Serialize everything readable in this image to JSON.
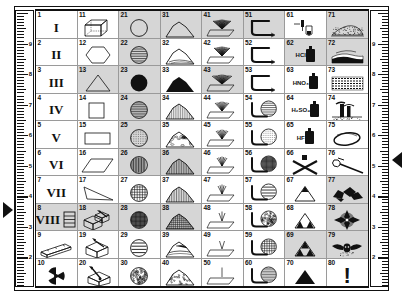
{
  "document": {
    "title": "Geological / Laboratory Symbol Legend Chart",
    "sheet_style": "boxed chart with vertical rulers on both margins"
  },
  "rulers": {
    "left": {
      "name": "left-ruler",
      "orientation": "vertical",
      "labels": [
        "9",
        "8",
        "7",
        "6",
        "5",
        "4",
        "3",
        "2",
        "1"
      ],
      "direction": "descending top to bottom",
      "minor_ticks_per_unit": 10
    },
    "right": {
      "name": "right-ruler",
      "orientation": "vertical",
      "labels": [
        "9",
        "8",
        "7",
        "6",
        "5",
        "4",
        "3",
        "2",
        "1"
      ],
      "direction": "descending top to bottom",
      "minor_ticks_per_unit": 10
    }
  },
  "markers": [
    {
      "name": "left-pointer",
      "glyph": "right-pointing-triangle",
      "side": "left"
    },
    {
      "name": "right-pointer",
      "glyph": "left-pointing-triangle",
      "side": "right"
    }
  ],
  "colors": {
    "ink": "#111111",
    "shade": "#d6d6d6",
    "gridline": "#9a9a9a",
    "paper": "#ffffff"
  },
  "grid": {
    "columns": 8,
    "rows": 10,
    "numbering": "column-major, 1-80",
    "cells": [
      {
        "n": "1",
        "icon": "roman-numeral-I",
        "text": "I",
        "shaded": false
      },
      {
        "n": "2",
        "icon": "roman-numeral-II",
        "text": "II",
        "shaded": false
      },
      {
        "n": "3",
        "icon": "roman-numeral-III",
        "text": "III",
        "shaded": false
      },
      {
        "n": "4",
        "icon": "roman-numeral-IV",
        "text": "IV",
        "shaded": false
      },
      {
        "n": "5",
        "icon": "roman-numeral-V",
        "text": "V",
        "shaded": false
      },
      {
        "n": "6",
        "icon": "roman-numeral-VI",
        "text": "VI",
        "shaded": false
      },
      {
        "n": "7",
        "icon": "roman-numeral-VII",
        "text": "VII",
        "shaded": false
      },
      {
        "n": "8",
        "icon": "roman-numeral-VIII-ladder",
        "text": "VIII",
        "shaded": true
      },
      {
        "n": "9",
        "icon": "timber-beam-icon",
        "text": "",
        "shaded": false
      },
      {
        "n": "10",
        "icon": "radioactive-trefoil-icon",
        "text": "",
        "shaded": false
      },
      {
        "n": "11",
        "icon": "wireframe-cube-icon",
        "text": "",
        "shaded": false
      },
      {
        "n": "12",
        "icon": "hexagon-outline-icon",
        "text": "",
        "shaded": false
      },
      {
        "n": "13",
        "icon": "triangle-outline-icon",
        "text": "",
        "shaded": true
      },
      {
        "n": "14",
        "icon": "square-outline-icon",
        "text": "",
        "shaded": false
      },
      {
        "n": "15",
        "icon": "rectangle-outline-icon",
        "text": "",
        "shaded": false
      },
      {
        "n": "16",
        "icon": "parallelogram-outline-icon",
        "text": "",
        "shaded": false
      },
      {
        "n": "17",
        "icon": "thin-wedge-outline-icon",
        "text": "",
        "shaded": false
      },
      {
        "n": "18",
        "icon": "boxes-with-hammer-icon",
        "text": "",
        "shaded": true
      },
      {
        "n": "19",
        "icon": "box-with-hammer-icon",
        "text": "",
        "shaded": false
      },
      {
        "n": "20",
        "icon": "chisel-and-box-icon",
        "text": "",
        "shaded": false
      },
      {
        "n": "21",
        "icon": "circle-outline-icon",
        "text": "",
        "shaded": true
      },
      {
        "n": "22",
        "icon": "circle-horizontal-lines-icon",
        "text": "",
        "shaded": true
      },
      {
        "n": "23",
        "icon": "circle-solid-icon",
        "text": "",
        "shaded": true
      },
      {
        "n": "24",
        "icon": "circle-dense-lines-icon",
        "text": "",
        "shaded": true
      },
      {
        "n": "25",
        "icon": "circle-dotted-lines-icon",
        "text": "",
        "shaded": true
      },
      {
        "n": "26",
        "icon": "circle-vertical-lines-icon",
        "text": "",
        "shaded": true
      },
      {
        "n": "27",
        "icon": "circle-crosshatch-light-icon",
        "text": "",
        "shaded": false
      },
      {
        "n": "28",
        "icon": "circle-dense-grid-icon",
        "text": "",
        "shaded": true
      },
      {
        "n": "29",
        "icon": "circle-wide-lines-icon",
        "text": "",
        "shaded": false
      },
      {
        "n": "30",
        "icon": "circle-speckled-icon",
        "text": "",
        "shaded": false
      },
      {
        "n": "31",
        "icon": "hill-profile-outline-icon",
        "text": "",
        "shaded": true
      },
      {
        "n": "32",
        "icon": "low-hill-layered-icon",
        "text": "",
        "shaded": false
      },
      {
        "n": "33",
        "icon": "hill-solid-black-icon",
        "text": "",
        "shaded": false
      },
      {
        "n": "34",
        "icon": "hill-hatched-icon",
        "text": "",
        "shaded": false
      },
      {
        "n": "35",
        "icon": "hill-cobble-texture-icon",
        "text": "",
        "shaded": false
      },
      {
        "n": "36",
        "icon": "hill-vertical-hatch-icon",
        "text": "",
        "shaded": true
      },
      {
        "n": "37",
        "icon": "hill-dense-vertical-icon",
        "text": "",
        "shaded": false
      },
      {
        "n": "38",
        "icon": "hill-crosshatch-icon",
        "text": "",
        "shaded": true
      },
      {
        "n": "39",
        "icon": "hill-banded-icon",
        "text": "",
        "shaded": false
      },
      {
        "n": "40",
        "icon": "hill-rubble-icon",
        "text": "",
        "shaded": false
      },
      {
        "n": "41",
        "icon": "dense-spray-on-plane-icon",
        "text": "",
        "shaded": true
      },
      {
        "n": "42",
        "icon": "spray-on-plane-icon",
        "text": "",
        "shaded": false
      },
      {
        "n": "43",
        "icon": "wide-spray-on-plane-icon",
        "text": "",
        "shaded": true
      },
      {
        "n": "44",
        "icon": "medium-spray-on-plane-icon",
        "text": "",
        "shaded": false
      },
      {
        "n": "45",
        "icon": "narrow-spray-on-plane-icon",
        "text": "",
        "shaded": false
      },
      {
        "n": "46",
        "icon": "few-rays-on-plane-icon",
        "text": "",
        "shaded": false
      },
      {
        "n": "47",
        "icon": "fewer-rays-on-plane-icon",
        "text": "",
        "shaded": false
      },
      {
        "n": "48",
        "icon": "three-rays-on-plane-icon",
        "text": "",
        "shaded": false
      },
      {
        "n": "49",
        "icon": "two-rays-on-plane-icon",
        "text": "",
        "shaded": false
      },
      {
        "n": "50",
        "icon": "single-ray-on-plane-icon",
        "text": "",
        "shaded": false
      },
      {
        "n": "51",
        "icon": "bent-pipe-flat-icon",
        "text": "",
        "shaded": true
      },
      {
        "n": "52",
        "icon": "bent-pipe-nozzle-icon",
        "text": "",
        "shaded": false
      },
      {
        "n": "53",
        "icon": "bent-pipe-long-icon",
        "text": "",
        "shaded": false
      },
      {
        "n": "54",
        "icon": "pipe-with-lined-sphere-icon",
        "text": "",
        "shaded": false
      },
      {
        "n": "55",
        "icon": "pipe-with-dotted-sphere-icon",
        "text": "",
        "shaded": false
      },
      {
        "n": "56",
        "icon": "pipe-with-grid-sphere-icon",
        "text": "",
        "shaded": false
      },
      {
        "n": "57",
        "icon": "pipe-with-banded-sphere-icon",
        "text": "",
        "shaded": false
      },
      {
        "n": "58",
        "icon": "pipe-with-speckled-sphere-icon",
        "text": "",
        "shaded": false
      },
      {
        "n": "59",
        "icon": "pipe-with-crosshatch-sphere-icon",
        "text": "",
        "shaded": false
      },
      {
        "n": "60",
        "icon": "pipe-with-hatched-sphere-icon",
        "text": "",
        "shaded": false
      },
      {
        "n": "61",
        "icon": "dropper-and-vial-icon",
        "text": "",
        "shaded": false
      },
      {
        "n": "62",
        "icon": "reagent-bottle-icon",
        "text": "HCl",
        "shaded": true
      },
      {
        "n": "63",
        "icon": "reagent-bottle-icon",
        "text": "HNO₃",
        "shaded": false
      },
      {
        "n": "64",
        "icon": "reagent-bottle-icon",
        "text": "H₂SO₄",
        "shaded": false
      },
      {
        "n": "65",
        "icon": "reagent-bottle-icon",
        "text": "HF",
        "shaded": false
      },
      {
        "n": "66",
        "icon": "bottle-crossed-out-icon",
        "text": "",
        "shaded": false
      },
      {
        "n": "67",
        "icon": "triangle-one-black-peak-icon",
        "text": "",
        "shaded": false
      },
      {
        "n": "68",
        "icon": "triangle-two-black-base-icon",
        "text": "",
        "shaded": false
      },
      {
        "n": "69",
        "icon": "sierpinski-triangle-icon",
        "text": "",
        "shaded": true
      },
      {
        "n": "70",
        "icon": "triangle-solid-black-icon",
        "text": "",
        "shaded": false
      },
      {
        "n": "71",
        "icon": "stippled-mound-landscape-icon",
        "text": "",
        "shaded": true
      },
      {
        "n": "72",
        "icon": "dark-terrain-ridge-icon",
        "text": "",
        "shaded": true
      },
      {
        "n": "73",
        "icon": "stratified-rock-bed-icon",
        "text": "",
        "shaded": false
      },
      {
        "n": "74",
        "icon": "industrial-stacks-icon",
        "text": "",
        "shaded": false
      },
      {
        "n": "75",
        "icon": "oval-basin-outline-icon",
        "text": "",
        "shaded": false
      },
      {
        "n": "76",
        "icon": "rock-hammer-icon",
        "text": "",
        "shaded": false
      },
      {
        "n": "77",
        "icon": "broken-rock-fragments-icon",
        "text": "",
        "shaded": true
      },
      {
        "n": "78",
        "icon": "compass-rose-disc-icon",
        "text": "",
        "shaded": true
      },
      {
        "n": "79",
        "icon": "winged-emblem-icon",
        "text": "",
        "shaded": true
      },
      {
        "n": "80",
        "icon": "exclamation-mark-icon",
        "text": "!",
        "shaded": false
      }
    ]
  }
}
